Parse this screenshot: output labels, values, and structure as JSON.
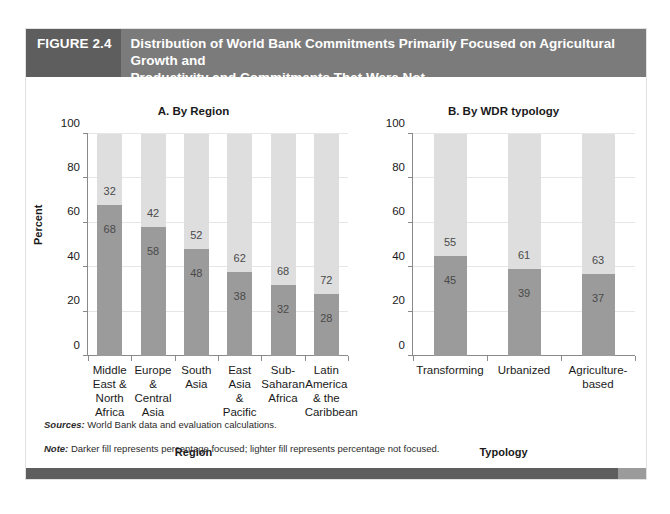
{
  "header": {
    "figure_number": "FIGURE 2.4",
    "title_line1": "Distribution of World Bank Commitments Primarily Focused on Agricultural Growth and",
    "title_line2": "Productivity and Commitments That Were Not"
  },
  "yaxis_title": "Percent",
  "notes": {
    "sources_label": "Sources:",
    "sources_text": " World Bank data and evaluation calculations.",
    "note_label": "Note:",
    "note_text": " Darker fill represents percentage focused; lighter fill represents percentage not focused."
  },
  "colors": {
    "focused_fill": "#9b9b9b",
    "not_focused_fill": "#dedede",
    "header_band": "#7b7b7b",
    "header_number_band": "#5e5e5e",
    "footer_bar": "#5e5e5e",
    "footer_bar_end": "#9b9b9b",
    "axis": "#8a8a8a",
    "gridline": "#e6e6e6"
  },
  "chart_data": [
    {
      "type": "bar",
      "title": "A. By Region",
      "subtitle": "",
      "stacked": true,
      "xlabel": "Region",
      "ylabel": "Percent",
      "ylim": [
        0,
        100
      ],
      "yticks": [
        0,
        20,
        40,
        60,
        80,
        100
      ],
      "grid": true,
      "legend_position": "none",
      "categories": [
        "Middle East & North Africa",
        "Europe & Central Asia",
        "South Asia",
        "East Asia & Pacific",
        "Sub-Saharan Africa",
        "Latin America & the Caribbean"
      ],
      "category_lines": [
        [
          "Middle",
          "East &",
          "North",
          "Africa"
        ],
        [
          "Europe",
          "&",
          "Central",
          "Asia"
        ],
        [
          "South",
          "Asia"
        ],
        [
          "East Asia",
          "&",
          "Pacific"
        ],
        [
          "Sub-",
          "Saharan",
          "Africa"
        ],
        [
          "Latin",
          "America",
          "& the",
          "Caribbean"
        ]
      ],
      "series": [
        {
          "name": "Percentage focused",
          "values": [
            68,
            58,
            48,
            38,
            32,
            28
          ]
        },
        {
          "name": "Percentage not focused",
          "values": [
            32,
            42,
            52,
            62,
            68,
            72
          ]
        }
      ]
    },
    {
      "type": "bar",
      "title": "B. By WDR typology",
      "subtitle": "",
      "stacked": true,
      "xlabel": "Typology",
      "ylabel": "Percent",
      "ylim": [
        0,
        100
      ],
      "yticks": [
        0,
        20,
        40,
        60,
        80,
        100
      ],
      "grid": true,
      "legend_position": "none",
      "categories": [
        "Transforming",
        "Urbanized",
        "Agriculture-based"
      ],
      "category_lines": [
        [
          "Transforming"
        ],
        [
          "Urbanized"
        ],
        [
          "Agriculture-",
          "based"
        ]
      ],
      "series": [
        {
          "name": "Percentage focused",
          "values": [
            45,
            39,
            37
          ]
        },
        {
          "name": "Percentage not focused",
          "values": [
            55,
            61,
            63
          ]
        }
      ]
    }
  ]
}
